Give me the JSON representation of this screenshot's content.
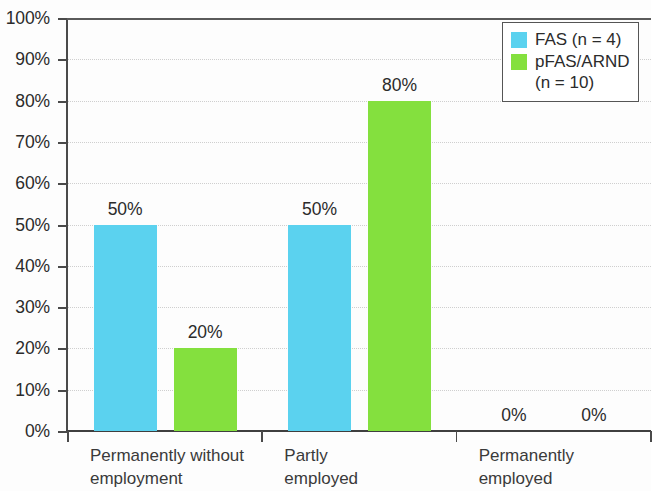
{
  "chart_data": {
    "type": "bar",
    "title": "",
    "subtitle": "",
    "xlabel": "",
    "ylabel": "",
    "ylim": [
      0,
      100
    ],
    "y_unit": "%",
    "grid": true,
    "legend_position": "top-right",
    "categories": [
      "Permanently without employment",
      "Partly employed",
      "Permanently employed"
    ],
    "category_lines": [
      [
        "Permanently without",
        "employment"
      ],
      [
        "Partly",
        "employed"
      ],
      [
        "Permanently",
        "employed"
      ]
    ],
    "series": [
      {
        "name": "FAS (n = 4)",
        "short_name": "FAS",
        "color": "#5bd2ef",
        "values": [
          50,
          50,
          0
        ],
        "value_labels": [
          "50%",
          "50%",
          "0%"
        ]
      },
      {
        "name": "pFAS/ARND (n = 10)",
        "short_name": "pFAS/ARND",
        "color": "#84e03e",
        "values": [
          20,
          80,
          0
        ],
        "value_labels": [
          "20%",
          "80%",
          "0%"
        ]
      }
    ],
    "y_ticks": [
      0,
      10,
      20,
      30,
      40,
      50,
      60,
      70,
      80,
      90,
      100
    ],
    "y_tick_labels": [
      "0%",
      "10%",
      "20%",
      "30%",
      "40%",
      "50%",
      "60%",
      "70%",
      "80%",
      "90%",
      "100%"
    ]
  },
  "legend": {
    "entries": [
      {
        "label": "FAS (n = 4)",
        "color": "#5bd2ef"
      },
      {
        "label": "pFAS/ARND\n(n = 10)",
        "color": "#84e03e"
      }
    ]
  },
  "colors": {
    "fas": "#5bd2ef",
    "pfas": "#84e03e",
    "axis": "#4a4a4a",
    "grid": "#cfcfcf",
    "text": "#2b2b2b",
    "background": "#ffffff"
  }
}
